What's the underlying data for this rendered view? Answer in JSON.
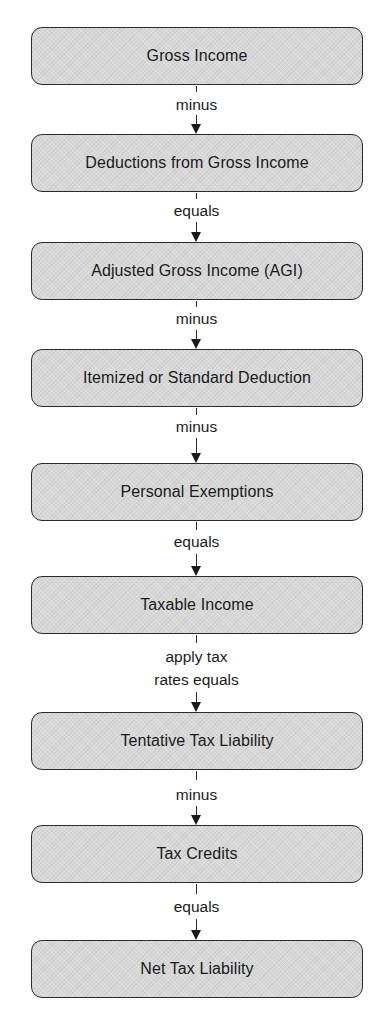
{
  "diagram": {
    "type": "vertical-flowchart",
    "title": "",
    "nodes": [
      {
        "id": "n1",
        "label": "Gross Income"
      },
      {
        "id": "n2",
        "label": "Deductions from Gross Income"
      },
      {
        "id": "n3",
        "label": "Adjusted Gross Income (AGI)"
      },
      {
        "id": "n4",
        "label": "Itemized or Standard Deduction"
      },
      {
        "id": "n5",
        "label": "Personal Exemptions"
      },
      {
        "id": "n6",
        "label": "Taxable Income"
      },
      {
        "id": "n7",
        "label": "Tentative Tax Liability"
      },
      {
        "id": "n8",
        "label": "Tax Credits"
      },
      {
        "id": "n9",
        "label": "Net Tax Liability"
      }
    ],
    "edges": [
      {
        "from": "n1",
        "to": "n2",
        "label": "minus"
      },
      {
        "from": "n2",
        "to": "n3",
        "label": "equals"
      },
      {
        "from": "n3",
        "to": "n4",
        "label": "minus"
      },
      {
        "from": "n4",
        "to": "n5",
        "label": "minus"
      },
      {
        "from": "n5",
        "to": "n6",
        "label": "equals"
      },
      {
        "from": "n6",
        "to": "n7",
        "label_line1": "apply tax",
        "label_line2": "rates equals"
      },
      {
        "from": "n7",
        "to": "n8",
        "label": "minus"
      },
      {
        "from": "n8",
        "to": "n9",
        "label": "equals"
      }
    ],
    "colors": {
      "box_fill": "#d8d8d8",
      "box_border": "#2b2b2b",
      "text": "#1a1a1a",
      "background": "#ffffff"
    }
  }
}
